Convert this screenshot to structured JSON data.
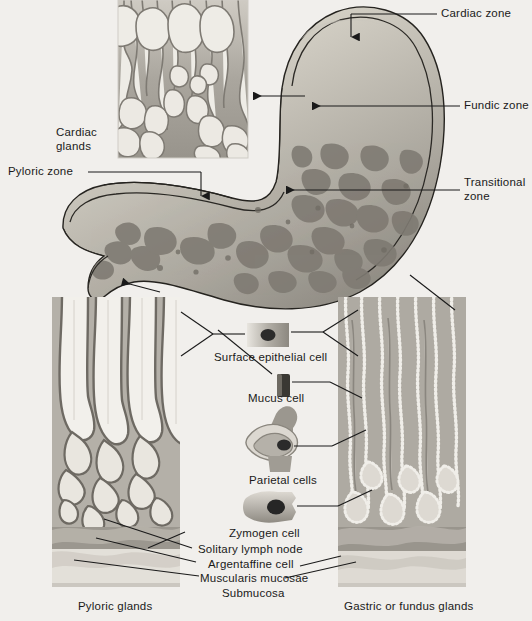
{
  "figure": {
    "background_color": "#f1efec",
    "line_color": "#1a1a1a",
    "tissue_colors": {
      "mucosa_light": "#e7e4dd",
      "mucosa_mid": "#b9b5ad",
      "mucosa_dark": "#8d8982",
      "lumen": "#f4f2ee",
      "outline": "#7d7a73",
      "submucosa": "#d8d5ce",
      "muscularis": "#9b978f",
      "nucleus": "#2b2b2b"
    }
  },
  "labels": {
    "cardiac_zone": "Cardiac zone",
    "fundic_zone": "Fundic zone",
    "transitional_zone": "Transitional\nzone",
    "transitional_zone_line1": "Transitional",
    "transitional_zone_line2": "zone",
    "pyloric_zone": "Pyloric zone",
    "cardiac_glands_line1": "Cardiac",
    "cardiac_glands_line2": "glands",
    "surface_epithelial_cell": "Surface epithelial cell",
    "mucus_cell": "Mucus cell",
    "parietal_cells": "Parietal cells",
    "zymogen_cell": "Zymogen cell",
    "solitary_lymph_node": "Solitary lymph node",
    "argentaffine_cell": "Argentaffine cell",
    "muscularis_mucosae": "Muscularis mucosae",
    "submucosa": "Submucosa",
    "pyloric_glands": "Pyloric glands",
    "gastric_or_fundus_glands": "Gastric or fundus glands"
  },
  "panels": {
    "cardiac_glands_inset": {
      "name": "Cardiac glands inset"
    },
    "stomach": {
      "name": "Stomach gross section with rugae"
    },
    "pyloric_glands_panel": {
      "name": "Pyloric glands histology panel"
    },
    "fundus_glands_panel": {
      "name": "Gastric or fundus glands histology panel"
    }
  },
  "cells": [
    {
      "name": "Surface epithelial cell",
      "shape": "columnar"
    },
    {
      "name": "Mucus cell",
      "shape": "small-columnar-dark"
    },
    {
      "name": "Parietal cells",
      "shape": "oval-with-canaliculi"
    },
    {
      "name": "Zymogen cell",
      "shape": "flask"
    }
  ]
}
